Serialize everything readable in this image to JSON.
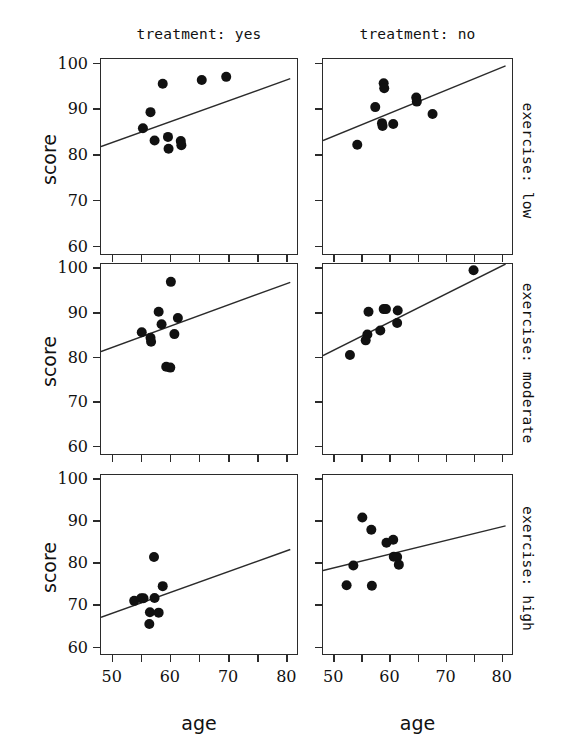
{
  "chart_data": {
    "type": "scatter",
    "title": "",
    "xlabel": "age",
    "ylabel": "score",
    "xlim": [
      48,
      82
    ],
    "ylim": [
      58,
      101
    ],
    "xticks": [
      50,
      60,
      70,
      80
    ],
    "yticks": [
      60,
      70,
      80,
      90,
      100
    ],
    "x_minor_ticks": [
      50,
      55,
      60,
      65,
      70,
      75,
      80
    ],
    "grid": false,
    "legend": false,
    "layout": "facet-grid 3 rows x 2 cols",
    "column_labels": [
      "treatment: yes",
      "treatment: no"
    ],
    "row_labels": [
      "exercise: low",
      "exercise: moderate",
      "exercise: high"
    ],
    "facet_col_variable": "treatment",
    "facet_row_variable": "exercise",
    "point_color": "#111111",
    "line_color": "#2b2b2b",
    "panels": [
      {
        "row": 0,
        "col": 0,
        "row_label": "exercise: low",
        "col_label": "treatment: yes",
        "points": [
          {
            "x": 55.2,
            "y": 85.9
          },
          {
            "x": 56.5,
            "y": 89.4
          },
          {
            "x": 57.2,
            "y": 83.2
          },
          {
            "x": 58.6,
            "y": 95.6
          },
          {
            "x": 59.5,
            "y": 84.0
          },
          {
            "x": 59.6,
            "y": 81.4
          },
          {
            "x": 61.7,
            "y": 83.1
          },
          {
            "x": 61.8,
            "y": 82.2
          },
          {
            "x": 65.3,
            "y": 96.4
          },
          {
            "x": 69.5,
            "y": 97.1
          }
        ],
        "fit_line": {
          "x0": 48.0,
          "y0": 81.9,
          "x1": 80.5,
          "y1": 96.7
        }
      },
      {
        "row": 0,
        "col": 1,
        "row_label": "exercise: low",
        "col_label": "treatment: no",
        "points": [
          {
            "x": 54.1,
            "y": 82.3
          },
          {
            "x": 57.3,
            "y": 90.5
          },
          {
            "x": 58.8,
            "y": 95.7
          },
          {
            "x": 58.9,
            "y": 94.6
          },
          {
            "x": 58.5,
            "y": 87.0
          },
          {
            "x": 58.6,
            "y": 86.4
          },
          {
            "x": 60.5,
            "y": 86.8
          },
          {
            "x": 64.6,
            "y": 92.6
          },
          {
            "x": 64.7,
            "y": 91.7
          },
          {
            "x": 67.5,
            "y": 89.0
          }
        ],
        "fit_line": {
          "x0": 48.0,
          "y0": 83.2,
          "x1": 80.5,
          "y1": 99.5
        }
      },
      {
        "row": 1,
        "col": 0,
        "row_label": "exercise: moderate",
        "col_label": "treatment: yes",
        "points": [
          {
            "x": 55.0,
            "y": 85.7
          },
          {
            "x": 56.5,
            "y": 84.5
          },
          {
            "x": 56.6,
            "y": 83.6
          },
          {
            "x": 57.9,
            "y": 90.3
          },
          {
            "x": 58.4,
            "y": 87.5
          },
          {
            "x": 59.2,
            "y": 78.0
          },
          {
            "x": 59.9,
            "y": 77.8
          },
          {
            "x": 60.0,
            "y": 97.0
          },
          {
            "x": 60.6,
            "y": 85.3
          },
          {
            "x": 61.2,
            "y": 88.9
          }
        ],
        "fit_line": {
          "x0": 48.0,
          "y0": 81.4,
          "x1": 80.5,
          "y1": 96.9
        }
      },
      {
        "row": 1,
        "col": 1,
        "row_label": "exercise: moderate",
        "col_label": "treatment: no",
        "points": [
          {
            "x": 52.8,
            "y": 80.6
          },
          {
            "x": 55.9,
            "y": 85.2
          },
          {
            "x": 55.6,
            "y": 83.9
          },
          {
            "x": 56.1,
            "y": 90.3
          },
          {
            "x": 58.2,
            "y": 86.1
          },
          {
            "x": 58.8,
            "y": 90.9
          },
          {
            "x": 59.2,
            "y": 90.9
          },
          {
            "x": 61.3,
            "y": 90.6
          },
          {
            "x": 61.2,
            "y": 87.8
          },
          {
            "x": 74.8,
            "y": 99.6
          }
        ],
        "fit_line": {
          "x0": 48.0,
          "y0": 80.5,
          "x1": 80.5,
          "y1": 101.0
        }
      },
      {
        "row": 2,
        "col": 0,
        "row_label": "exercise: high",
        "col_label": "treatment: yes",
        "points": [
          {
            "x": 53.7,
            "y": 71.1
          },
          {
            "x": 54.9,
            "y": 71.7
          },
          {
            "x": 55.3,
            "y": 71.7
          },
          {
            "x": 56.4,
            "y": 68.4
          },
          {
            "x": 56.3,
            "y": 65.6
          },
          {
            "x": 57.1,
            "y": 81.5
          },
          {
            "x": 57.2,
            "y": 71.8
          },
          {
            "x": 57.9,
            "y": 68.3
          },
          {
            "x": 58.6,
            "y": 74.6
          }
        ],
        "fit_line": {
          "x0": 48.0,
          "y0": 67.2,
          "x1": 80.5,
          "y1": 83.3
        }
      },
      {
        "row": 2,
        "col": 1,
        "row_label": "exercise: high",
        "col_label": "treatment: no",
        "points": [
          {
            "x": 52.2,
            "y": 74.8
          },
          {
            "x": 53.4,
            "y": 79.5
          },
          {
            "x": 55.0,
            "y": 90.9
          },
          {
            "x": 56.6,
            "y": 88.0
          },
          {
            "x": 56.7,
            "y": 74.7
          },
          {
            "x": 59.3,
            "y": 84.9
          },
          {
            "x": 60.5,
            "y": 85.6
          },
          {
            "x": 60.6,
            "y": 81.6
          },
          {
            "x": 61.2,
            "y": 81.5
          },
          {
            "x": 61.5,
            "y": 79.7
          }
        ],
        "fit_line": {
          "x0": 48.0,
          "y0": 78.3,
          "x1": 80.5,
          "y1": 88.9
        }
      }
    ]
  },
  "axis": {
    "x_title": "age",
    "y_title": "score",
    "y_tick_labels": [
      "100",
      "90",
      "80",
      "70",
      "60"
    ],
    "x_tick_labels": [
      "50",
      "60",
      "70",
      "80"
    ]
  },
  "strips": {
    "columns": [
      "treatment: yes",
      "treatment: no"
    ],
    "rows": [
      "exercise: low",
      "exercise: moderate",
      "exercise: high"
    ]
  }
}
